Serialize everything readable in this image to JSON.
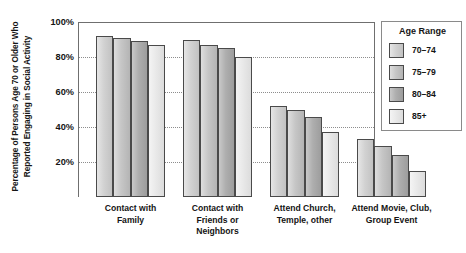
{
  "chart_data": {
    "type": "bar",
    "title": "",
    "subtitle": "",
    "xlabel": "",
    "ylabel": "Percentage of Persons Age 70 or Older Who Reported Engaging in Social Activity",
    "ylim": [
      0,
      100
    ],
    "ytick_labels": [
      "20%",
      "40%",
      "60%",
      "80%",
      "100%"
    ],
    "ytick_values": [
      20,
      40,
      60,
      80,
      100
    ],
    "grid": true,
    "grid_axis": "y",
    "legend_position": "right",
    "legend_title": "Age Range",
    "categories": [
      "Contact with Family",
      "Contact with Friends or Neighbors",
      "Attend Church, Temple, other",
      "Attend Movie, Club, Group Event"
    ],
    "category_lines": [
      [
        "Contact with",
        "Family"
      ],
      [
        "Contact with",
        "Friends or",
        "Neighbors"
      ],
      [
        "Attend Church,",
        "Temple, other"
      ],
      [
        "Attend Movie, Club,",
        "Group Event"
      ]
    ],
    "series": [
      {
        "name": "70–74",
        "values": [
          92,
          90,
          52,
          33
        ],
        "color": "#d2d2d2"
      },
      {
        "name": "75–79",
        "values": [
          91,
          87,
          50,
          29
        ],
        "color": "#c6c6c6"
      },
      {
        "name": "80–84",
        "values": [
          89,
          85,
          46,
          24
        ],
        "color": "#aeaeae"
      },
      {
        "name": "85+",
        "values": [
          87,
          80,
          37,
          15
        ],
        "color": "#e9e9e9"
      }
    ]
  },
  "colors": {
    "axis": "#6f6f6f",
    "grid": "#8d8d8d",
    "bar_outline": "#4a4a4a",
    "text": "#141414",
    "background": "#ffffff"
  }
}
